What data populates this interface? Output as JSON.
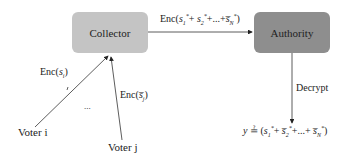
{
  "nodes": {
    "collector": {
      "label": "Collector",
      "fill": "#c4c4c4"
    },
    "authority": {
      "label": "Authority",
      "fill": "#8e8e8e"
    },
    "voter_i": {
      "label": "Voter i"
    },
    "voter_j": {
      "label": "Voter j"
    }
  },
  "edges": {
    "voter_i_to_collector": {
      "label": "Enc(sᵢ)",
      "label_func": "Enc(",
      "label_var": "s",
      "label_sub": "i",
      "label_close": ")"
    },
    "voter_j_to_collector": {
      "label": "Enc(s̅ⱼ)",
      "label_func": "Enc(",
      "label_var": "s̅",
      "label_sub": "j",
      "label_close": ")"
    },
    "collector_to_authority": {
      "label": "Enc(s₁* + s₂* + ... + s̅ₙ*)",
      "label_func": "Enc(",
      "terms": [
        {
          "var": "s",
          "sub": "1",
          "sup": "*"
        },
        {
          "var": "s",
          "sub": "2",
          "sup": "*"
        },
        {
          "var": "s̅",
          "sub": "N",
          "sup": "*"
        }
      ],
      "ellipsis": "...",
      "label_close": ")"
    },
    "authority_to_result": {
      "label": "Decrypt"
    }
  },
  "ellipsis_between_voters": "...",
  "result": {
    "lhs": "y",
    "relation": "≟",
    "expression": "(s₁* + s̅₂* + ... + s̅ₙ*)",
    "open": "(",
    "terms": [
      {
        "var": "s",
        "sub": "1",
        "sup": "*"
      },
      {
        "var": "s̅",
        "sub": "2",
        "sup": "*"
      },
      {
        "var": "s̅",
        "sub": "N",
        "sup": "*"
      }
    ],
    "ellipsis": "...",
    "close": ")"
  },
  "colors": {
    "line": "#333333",
    "collector_fill": "#c4c4c4",
    "authority_fill": "#8e8e8e"
  }
}
